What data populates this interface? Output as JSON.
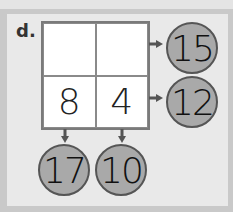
{
  "problem": {
    "label": "d.",
    "grid": {
      "rows": [
        [
          "",
          ""
        ],
        [
          "8",
          "4"
        ]
      ]
    },
    "row_sums": [
      "15",
      "12"
    ],
    "column_sums": [
      "17",
      "10"
    ]
  },
  "colors": {
    "panel": "#e9e9e9",
    "background": "#c9c9c9",
    "circle_fill": "#a9a9a9",
    "arrow": "#555555"
  }
}
